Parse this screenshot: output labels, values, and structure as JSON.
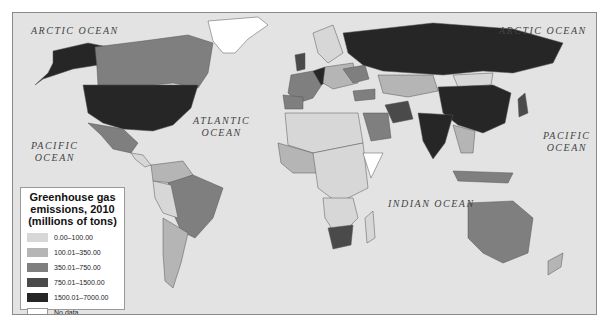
{
  "map": {
    "type": "choropleth world map",
    "ocean_labels": [
      {
        "id": "arctic-west",
        "text": "ARCTIC OCEAN"
      },
      {
        "id": "arctic-east",
        "text": "ARCTIC OCEAN"
      },
      {
        "id": "atlantic",
        "line1": "ATLANTIC",
        "line2": "OCEAN"
      },
      {
        "id": "pacific-west",
        "line1": "PACIFIC",
        "line2": "OCEAN"
      },
      {
        "id": "pacific-east",
        "line1": "PACIFIC",
        "line2": "OCEAN"
      },
      {
        "id": "indian",
        "text": "INDIAN OCEAN"
      }
    ],
    "colors": {
      "ocean": "#e3e3e3",
      "border": "#555555"
    }
  },
  "legend": {
    "title_line1": "Greenhouse gas",
    "title_line2": "emissions, 2010",
    "title_line3": "(millions of tons)",
    "items": [
      {
        "label": "0.00–100.00",
        "color": "#d7d7d7"
      },
      {
        "label": "100.01–350.00",
        "color": "#b5b5b5"
      },
      {
        "label": "350.01–750.00",
        "color": "#7f7f7f"
      },
      {
        "label": "750.01–1500.00",
        "color": "#4a4a4a"
      },
      {
        "label": "1500.01–7000.00",
        "color": "#262626"
      },
      {
        "label": "No data",
        "color": "#ffffff"
      }
    ]
  }
}
